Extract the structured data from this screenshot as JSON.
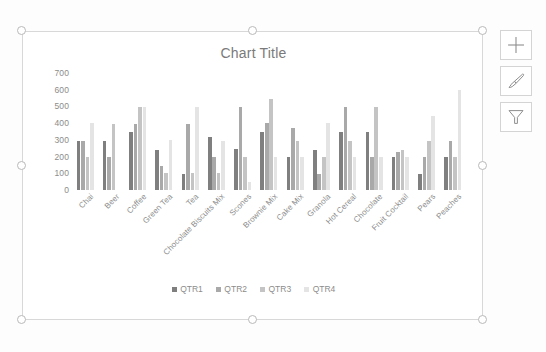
{
  "app": {
    "surface_name": "excel-chart-object",
    "selection_state": "selected"
  },
  "side_buttons": [
    {
      "name": "chart-elements-button",
      "icon": "plus-icon",
      "tooltip": "Chart Elements"
    },
    {
      "name": "chart-styles-button",
      "icon": "paintbrush-icon",
      "tooltip": "Chart Styles"
    },
    {
      "name": "chart-filters-button",
      "icon": "funnel-icon",
      "tooltip": "Chart Filters"
    }
  ],
  "selection_handles": [
    "handle-top-left",
    "handle-top-middle",
    "handle-top-right",
    "handle-middle-left",
    "handle-middle-right",
    "handle-bottom-left",
    "handle-bottom-middle",
    "handle-bottom-right"
  ],
  "colors": {
    "qtr1": "#7f7f7f",
    "qtr2": "#a9a9a9",
    "qtr3": "#c4c4c4",
    "qtr4": "#e4e4e4",
    "axis_text": "#8c8c8c",
    "title_text": "#7a7a7a",
    "frame_border": "#d8d8d8"
  },
  "chart_data": {
    "type": "bar",
    "title": "Chart Title",
    "xlabel": "",
    "ylabel": "",
    "ylim": [
      0,
      700
    ],
    "yticks": [
      700,
      600,
      500,
      400,
      300,
      200,
      100,
      0
    ],
    "grid": false,
    "legend_position": "bottom",
    "categories": [
      "Chai",
      "Beer",
      "Coffee",
      "Green Tea",
      "Tea",
      "Chocolate Biscuits Mix",
      "Scones",
      "Brownie Mix",
      "Cake Mix",
      "Granola",
      "Hot Cereal",
      "Chocolate",
      "Fruit Cocktail",
      "Pears",
      "Peaches"
    ],
    "series": [
      {
        "name": "QTR1",
        "color": "#7f7f7f",
        "values": [
          295,
          295,
          345,
          240,
          95,
          320,
          245,
          345,
          200,
          240,
          345,
          345,
          200,
          95,
          200
        ]
      },
      {
        "name": "QTR2",
        "color": "#a9a9a9",
        "values": [
          295,
          200,
          395,
          145,
          395,
          200,
          495,
          400,
          370,
          95,
          495,
          200,
          225,
          200,
          295
        ]
      },
      {
        "name": "QTR3",
        "color": "#c4c4c4",
        "values": [
          200,
          395,
          495,
          100,
          100,
          100,
          200,
          545,
          295,
          200,
          295,
          495,
          240,
          295,
          200
        ]
      },
      {
        "name": "QTR4",
        "color": "#e4e4e4",
        "values": [
          400,
          0,
          495,
          300,
          495,
          295,
          50,
          200,
          200,
          400,
          200,
          200,
          200,
          445,
          600
        ]
      }
    ]
  }
}
